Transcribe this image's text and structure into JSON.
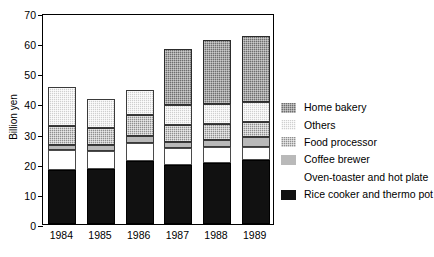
{
  "chart_data": {
    "type": "bar",
    "subtype": "stacked-bar",
    "title": "",
    "xlabel": "",
    "ylabel": "Billion yen",
    "ylim": [
      0,
      70
    ],
    "yticks": [
      0,
      10,
      20,
      30,
      40,
      50,
      60,
      70
    ],
    "ytick_labels": [
      "0",
      "10",
      "20",
      "30",
      "40",
      "50",
      "60",
      "70"
    ],
    "grid": false,
    "legend_position": "right",
    "categories": [
      "1984",
      "1985",
      "1986",
      "1987",
      "1988",
      "1989"
    ],
    "series": [
      {
        "name": "Rice cooker and thermo pot",
        "fill": "fill-black",
        "color": "#111111",
        "values": [
          17.8,
          18.3,
          21.0,
          19.6,
          20.4,
          21.4
        ]
      },
      {
        "name": "Oven-toaster and hot plate",
        "fill": "fill-white",
        "color": "#ffffff",
        "values": [
          6.8,
          5.9,
          6.0,
          5.5,
          5.0,
          4.1
        ]
      },
      {
        "name": "Coffee brewer",
        "fill": "fill-lightgray",
        "color": "#b9b9b9",
        "values": [
          1.7,
          2.1,
          2.1,
          2.0,
          2.6,
          3.4
        ]
      },
      {
        "name": "Food processor",
        "fill": "fill-midgray",
        "color": "#8f8f8f",
        "values": [
          6.3,
          5.6,
          7.0,
          5.8,
          5.3,
          5.1
        ]
      },
      {
        "name": "Others",
        "fill": "fill-checkerlight",
        "color": "#cfcfcf",
        "values": [
          12.7,
          9.7,
          8.3,
          6.6,
          6.6,
          6.6
        ]
      },
      {
        "name": "Home bakery",
        "fill": "fill-darkgray",
        "color": "#6e6e6e",
        "values": [
          0,
          0,
          0,
          18.7,
          21.1,
          21.7
        ]
      }
    ],
    "totals": [
      45.3,
      41.6,
      44.4,
      58.2,
      61.0,
      62.3
    ]
  },
  "legend": {
    "entries": [
      {
        "label": "Home bakery",
        "fill": "fill-darkgray"
      },
      {
        "label": "Others",
        "fill": "fill-checkerlight"
      },
      {
        "label": "Food processor",
        "fill": "fill-midgray"
      },
      {
        "label": "Coffee brewer",
        "fill": "fill-lightgray"
      },
      {
        "label": "Oven-toaster and hot plate",
        "fill": "fill-white"
      },
      {
        "label": "Rice cooker and thermo pot",
        "fill": "fill-black"
      }
    ]
  }
}
